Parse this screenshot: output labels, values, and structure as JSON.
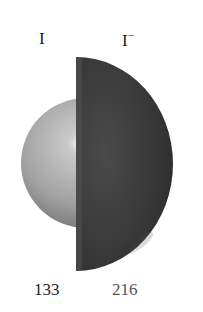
{
  "figure": {
    "atom": {
      "symbol": "I",
      "radius_label": "133"
    },
    "ion": {
      "symbol": "I",
      "charge": "−",
      "radius_label": "216"
    },
    "colors": {
      "atom_sphere": "#a8a8a8",
      "ion_sphere": "#3a3a3a",
      "text": "#222222",
      "ion_number_text": "#555555"
    }
  }
}
